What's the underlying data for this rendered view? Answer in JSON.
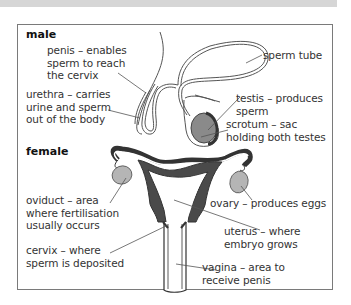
{
  "sections": {
    "male": {
      "heading": "male",
      "labels": {
        "penis": "penis – enables\nsperm to reach\nthe cervix",
        "urethra": "urethra – carries\nurine and sperm\nout of the body",
        "sperm_tube": "sperm tube",
        "testis": "testis – produces\nsperm",
        "scrotum": "scrotum – sac\nholding both testes"
      }
    },
    "female": {
      "heading": "female",
      "labels": {
        "oviduct": "oviduct – area\nwhere fertilisation\nusually occurs",
        "cervix": "cervix – where\nsperm is deposited",
        "ovary": "ovary – produces eggs",
        "uterus": "uterus – where\nembryo grows",
        "vagina": "vagina – area to\nreceive penis"
      }
    }
  },
  "colors": {
    "organ_fill": "#8a8a8a",
    "ovary_fill": "#b5b5b5",
    "dark_tissue": "#4a4a4a",
    "line": "#555555",
    "frame": "#7a7a7a",
    "top_band": "#d6d6d6"
  }
}
